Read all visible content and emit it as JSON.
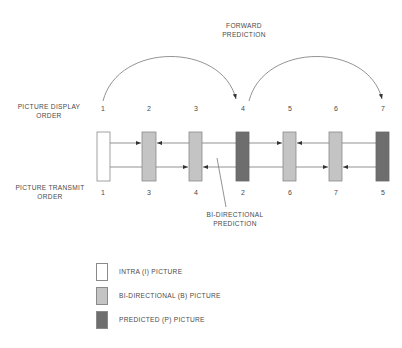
{
  "labels": {
    "forward_prediction": [
      "FORWARD",
      "PREDICTION"
    ],
    "display_order": [
      "PICTURE DISPLAY",
      "ORDER"
    ],
    "transmit_order": [
      "PICTURE TRANSMIT",
      "ORDER"
    ],
    "bidirectional_prediction": [
      "BI-DIRECTIONAL",
      "PREDICTION"
    ]
  },
  "pictures": [
    {
      "type": "I",
      "display": "1",
      "transmit": "1"
    },
    {
      "type": "B",
      "display": "2",
      "transmit": "3"
    },
    {
      "type": "B",
      "display": "3",
      "transmit": "4"
    },
    {
      "type": "P",
      "display": "4",
      "transmit": "2"
    },
    {
      "type": "B",
      "display": "5",
      "transmit": "6"
    },
    {
      "type": "B",
      "display": "6",
      "transmit": "7"
    },
    {
      "type": "P",
      "display": "7",
      "transmit": "5"
    }
  ],
  "legend": [
    {
      "type": "I",
      "label": "INTRA (I) PICTURE"
    },
    {
      "type": "B",
      "label": "BI-DIRECTIONAL (B) PICTURE"
    },
    {
      "type": "P",
      "label": "PREDICTED (P) PICTURE"
    }
  ],
  "colors": {
    "I": "#ffffff",
    "B": "#c4c4c4",
    "P": "#6e6e6e",
    "line": "#6a6a6a"
  }
}
